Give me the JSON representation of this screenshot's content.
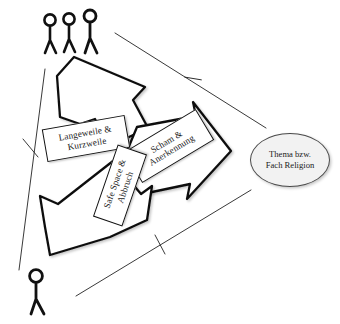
{
  "diagram": {
    "background_color": "#ffffff",
    "stroke_color": "#111111",
    "node_fill_color": "#f2f2f2",
    "arrows": [
      {
        "id": "arrow-up",
        "direction": "up",
        "label_line1": "Langeweile &",
        "label_line2": "Kurzweile"
      },
      {
        "id": "arrow-right",
        "direction": "right",
        "label_line1": "Scham &",
        "label_line2": "Anerkennung"
      },
      {
        "id": "arrow-down-left",
        "direction": "down-left",
        "label_line1": "Safe Space &",
        "label_line2": "Abbruch"
      }
    ],
    "labels": {
      "langeweile": {
        "line1": "Langeweile &",
        "line2": "Kurzweile"
      },
      "scham": {
        "line1": "Scham &",
        "line2": "Anerkennung"
      },
      "safespace": {
        "line1": "Safe Space &",
        "line2": "Abbruch"
      }
    },
    "node": {
      "line1": "Thema bzw.",
      "line2": "Fach Religion"
    },
    "figures": {
      "group_top_left": {
        "name": "three-stick-figures",
        "count": 3
      },
      "single_bottom_left": {
        "name": "single-stick-figure",
        "count": 1
      }
    },
    "triangle": {
      "sides": [
        {
          "id": "side-top-right",
          "tick": true
        },
        {
          "id": "side-bottom",
          "tick": true
        },
        {
          "id": "side-left",
          "tick": true
        }
      ]
    }
  }
}
